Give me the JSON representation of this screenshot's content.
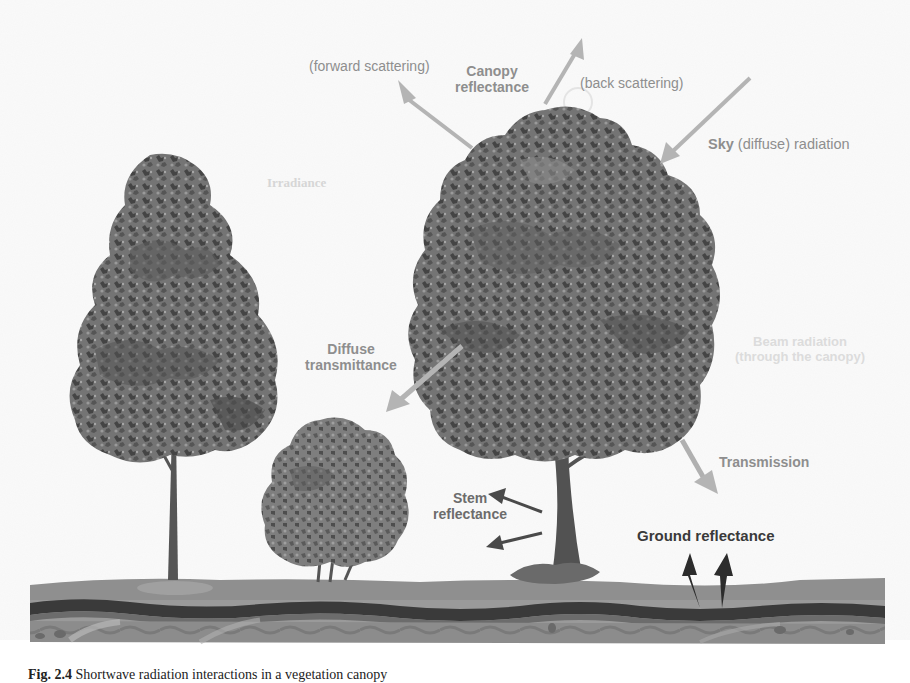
{
  "diagram": {
    "labels": {
      "forward_scattering": "(forward scattering)",
      "canopy_reflectance_1": "Canopy",
      "canopy_reflectance_2": "reflectance",
      "back_scattering": "(back scattering)",
      "sky_bold": "Sky",
      "sky_rest": " (diffuse) radiation",
      "irradiance": "Irradiance",
      "beam_1": "Beam radiation",
      "beam_2": "(through the canopy)",
      "diffuse_1": "Diffuse",
      "diffuse_2": "transmittance",
      "stem_1": "Stem",
      "stem_2": "reflectance",
      "transmission": "Transmission",
      "ground_reflectance": "Ground reflectance"
    },
    "elements": {
      "trees": [
        "tall-narrow-tree",
        "large-broadleaf-tree",
        "shrub"
      ],
      "ground_layers": [
        "grass-surface",
        "dark-soil-band",
        "subsoil-layers"
      ]
    },
    "arrows": [
      {
        "name": "forward-scattering-arrow",
        "direction": "up-left"
      },
      {
        "name": "back-scattering-arrow",
        "direction": "up-right"
      },
      {
        "name": "sky-radiation-arrow",
        "direction": "down-left"
      },
      {
        "name": "diffuse-transmittance-arrow",
        "direction": "down-left"
      },
      {
        "name": "stem-reflectance-arrow-upper",
        "direction": "left"
      },
      {
        "name": "stem-reflectance-arrow-lower",
        "direction": "left"
      },
      {
        "name": "transmission-arrow",
        "direction": "down-right"
      },
      {
        "name": "ground-reflectance-arrow-left",
        "direction": "up"
      },
      {
        "name": "ground-reflectance-arrow-right",
        "direction": "up"
      }
    ],
    "colors": {
      "label_gray": "#8e8e8e",
      "arrow_gray": "#b4b4b4",
      "arrow_dark": "#2c2c2c",
      "foliage_dark": "#4a4a4a",
      "foliage_mid": "#6e6e6e",
      "ground": "#8a8a8a",
      "soil_band": "#3c3c3c"
    },
    "caption": {
      "prefix": "Fig. 2.4",
      "text": "  Shortwave radiation interactions in a vegetation canopy"
    }
  }
}
